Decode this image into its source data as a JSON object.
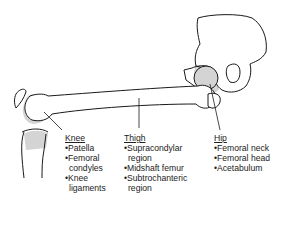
{
  "figure": {
    "bone_color": "#ffffff",
    "outline_color": "#1a1a1a",
    "region_shade": "#d4d4d4"
  },
  "regions": [
    {
      "id": "knee",
      "heading": "Knee",
      "items": [
        {
          "bullet": "•Patella"
        },
        {
          "bullet": "•Femoral",
          "cont": "condyles"
        },
        {
          "bullet": "•Knee",
          "cont": "ligaments"
        }
      ]
    },
    {
      "id": "thigh",
      "heading": "Thigh",
      "items": [
        {
          "bullet": "•Supracondylar",
          "cont": "region"
        },
        {
          "bullet": "•Midshaft femur"
        },
        {
          "bullet": "•Subtrochanteric",
          "cont": "region"
        }
      ]
    },
    {
      "id": "hip",
      "heading": "Hip",
      "items": [
        {
          "bullet": "•Femoral neck"
        },
        {
          "bullet": "•Femoral head"
        },
        {
          "bullet": "•Acetabulum"
        }
      ]
    }
  ]
}
